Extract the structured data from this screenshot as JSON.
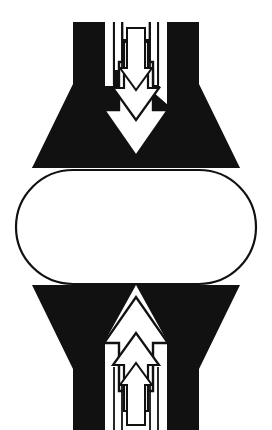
{
  "document": {
    "title": "Compression / Convergence Symbol",
    "kind": "monochrome-line-figure",
    "width": 272,
    "height": 430,
    "background_color": "#ffffff",
    "ink_color": "#111111"
  },
  "figure": {
    "name": "bidirectional-converging-arrows-symbol",
    "symmetry": "vertical mirror about y = 226; bilateral mirror about x = 136",
    "parts": [
      {
        "id": "top-mass",
        "label": "Top black trapezoid",
        "fill": "#111111",
        "points_down": true
      },
      {
        "id": "top-arrow-outer",
        "label": "Top outer white arrow",
        "fill": "#ffffff",
        "direction": "down"
      },
      {
        "id": "top-arrow-mid",
        "label": "Top middle white arrow",
        "fill": "#ffffff",
        "direction": "down"
      },
      {
        "id": "top-arrow-inner",
        "label": "Top inner white arrow",
        "fill": "#ffffff",
        "direction": "down"
      },
      {
        "id": "top-hairlines",
        "label": "Top thin vertical line pairs",
        "stroke": "#111111",
        "count": 4
      },
      {
        "id": "centre-stadium",
        "label": "Central stadium outline",
        "fill": "#ffffff",
        "stroke": "#111111",
        "stroke_width": 2
      },
      {
        "id": "bottom-mass",
        "label": "Bottom black trapezoid",
        "fill": "#111111",
        "points_down": false
      },
      {
        "id": "bottom-arrow-outer",
        "label": "Bottom outer white arrow",
        "fill": "#ffffff",
        "direction": "up"
      },
      {
        "id": "bottom-arrow-mid",
        "label": "Bottom middle white arrow",
        "fill": "#ffffff",
        "direction": "up"
      },
      {
        "id": "bottom-arrow-inner",
        "label": "Bottom inner white arrow",
        "fill": "#ffffff",
        "direction": "up"
      },
      {
        "id": "bottom-hairlines",
        "label": "Bottom thin vertical line pairs",
        "stroke": "#111111",
        "count": 4
      }
    ],
    "geometry": {
      "top_mass_path": "M 73,22 L 105,22 L 105,108 L 113,108 L 113,22 L 124,22 L 124,96 L 131,96 L 136,104 L 141,96 L 148,96 L 148,22 L 159,22 L 159,108 L 167,108 L 167,22 L 199,22 L 240,168 L 32,168 Z",
      "top_mass_arrow_cut": "M 104,86 L 104,112 L 88,112 L 136,166 L 184,112 L 168,112 L 168,86 L 153,86 L 153,64 L 145,64 L 145,92 L 136,102 L 127,92 L 127,64 L 119,64 L 119,86 Z",
      "centre_stadium": {
        "x": 16,
        "y": 170,
        "width": 240,
        "height": 114,
        "rx": 57
      },
      "bottom_mass_top_edge_y": 283,
      "bottom_mass_bottom_y": 421
    }
  }
}
